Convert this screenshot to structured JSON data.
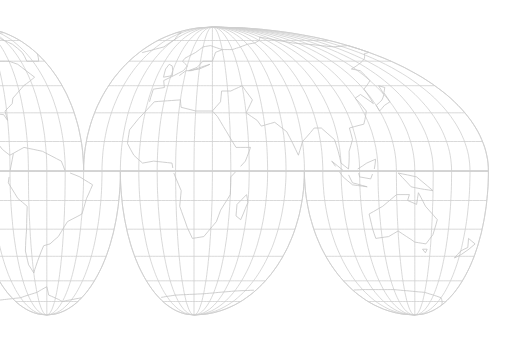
{
  "map": {
    "title": "",
    "projection": "interrupted-homolosine",
    "colors": {
      "background": "#ffffff",
      "graticule": "#cfcfcf",
      "coastline": "#c4c4c4"
    },
    "graticule": {
      "meridian_step_deg": 10,
      "parallel_step_deg": 15
    },
    "lobes": [
      {
        "name": "north-america",
        "hemisphere": "north",
        "lon_min": -180,
        "lon_max": -40,
        "central_meridian": -100
      },
      {
        "name": "eurasia",
        "hemisphere": "north",
        "lon_min": -40,
        "lon_max": 180,
        "central_meridian": 30
      },
      {
        "name": "south-america",
        "hemisphere": "south",
        "lon_min": -100,
        "lon_max": -20,
        "central_meridian": -60
      },
      {
        "name": "africa",
        "hemisphere": "south",
        "lon_min": -20,
        "lon_max": 80,
        "central_meridian": 20
      },
      {
        "name": "australia",
        "hemisphere": "south",
        "lon_min": 80,
        "lon_max": 180,
        "central_meridian": 140
      }
    ],
    "coastlines": [
      {
        "name": "north-america",
        "points": [
          [
            -168,
            66
          ],
          [
            -160,
            70
          ],
          [
            -140,
            70
          ],
          [
            -125,
            70
          ],
          [
            -110,
            68
          ],
          [
            -95,
            72
          ],
          [
            -85,
            68
          ],
          [
            -80,
            63
          ],
          [
            -92,
            58
          ],
          [
            -82,
            54
          ],
          [
            -78,
            60
          ],
          [
            -70,
            60
          ],
          [
            -64,
            58
          ],
          [
            -60,
            54
          ],
          [
            -56,
            50
          ],
          [
            -66,
            45
          ],
          [
            -70,
            42
          ],
          [
            -75,
            38
          ],
          [
            -76,
            35
          ],
          [
            -81,
            31
          ],
          [
            -80,
            26
          ],
          [
            -82,
            29
          ],
          [
            -90,
            30
          ],
          [
            -97,
            27
          ],
          [
            -97,
            22
          ],
          [
            -92,
            19
          ],
          [
            -87,
            21
          ],
          [
            -88,
            16
          ],
          [
            -84,
            11
          ],
          [
            -80,
            8
          ],
          [
            -78,
            9
          ]
        ]
      },
      {
        "name": "greenland",
        "points": [
          [
            -55,
            60
          ],
          [
            -45,
            60
          ],
          [
            -40,
            65
          ],
          [
            -22,
            70
          ],
          [
            -20,
            76
          ],
          [
            -30,
            82
          ],
          [
            -50,
            82
          ],
          [
            -65,
            78
          ],
          [
            -55,
            72
          ],
          [
            -53,
            66
          ],
          [
            -55,
            60
          ]
        ]
      },
      {
        "name": "south-america",
        "points": [
          [
            -78,
            9
          ],
          [
            -72,
            12
          ],
          [
            -62,
            10
          ],
          [
            -52,
            5
          ],
          [
            -50,
            0
          ],
          [
            -42,
            -3
          ],
          [
            -35,
            -7
          ],
          [
            -38,
            -14
          ],
          [
            -40,
            -22
          ],
          [
            -48,
            -26
          ],
          [
            -53,
            -34
          ],
          [
            -58,
            -38
          ],
          [
            -62,
            -39
          ],
          [
            -65,
            -45
          ],
          [
            -68,
            -51
          ],
          [
            -70,
            -55
          ],
          [
            -73,
            -50
          ],
          [
            -74,
            -42
          ],
          [
            -72,
            -30
          ],
          [
            -71,
            -18
          ],
          [
            -76,
            -14
          ],
          [
            -81,
            -6
          ],
          [
            -80,
            0
          ],
          [
            -78,
            9
          ]
        ]
      },
      {
        "name": "europe-africa",
        "points": [
          [
            -9,
            36
          ],
          [
            -9,
            43
          ],
          [
            -2,
            44
          ],
          [
            -4,
            48
          ],
          [
            2,
            51
          ],
          [
            8,
            54
          ],
          [
            10,
            57
          ],
          [
            5,
            60
          ],
          [
            6,
            62
          ],
          [
            14,
            66
          ],
          [
            20,
            70
          ],
          [
            28,
            71
          ],
          [
            40,
            68
          ],
          [
            33,
            66
          ],
          [
            30,
            60
          ],
          [
            22,
            60
          ],
          [
            18,
            56
          ],
          [
            12,
            54
          ],
          [
            20,
            55
          ],
          [
            28,
            58
          ],
          [
            24,
            57
          ],
          [
            14,
            54
          ],
          [
            10,
            54
          ],
          [
            6,
            51
          ]
        ]
      },
      {
        "name": "africa",
        "points": [
          [
            -6,
            36
          ],
          [
            10,
            37
          ],
          [
            11,
            33
          ],
          [
            20,
            31
          ],
          [
            30,
            31
          ],
          [
            33,
            28
          ],
          [
            38,
            20
          ],
          [
            43,
            12
          ],
          [
            51,
            12
          ],
          [
            48,
            5
          ],
          [
            40,
            -3
          ],
          [
            40,
            -12
          ],
          [
            35,
            -20
          ],
          [
            33,
            -26
          ],
          [
            26,
            -34
          ],
          [
            19,
            -35
          ],
          [
            16,
            -29
          ],
          [
            12,
            -18
          ],
          [
            13,
            -10
          ],
          [
            9,
            -1
          ],
          [
            8,
            4
          ],
          [
            -2,
            5
          ],
          [
            -8,
            4
          ],
          [
            -13,
            8
          ],
          [
            -17,
            14
          ],
          [
            -17,
            21
          ],
          [
            -13,
            27
          ],
          [
            -9,
            32
          ],
          [
            -6,
            36
          ]
        ]
      },
      {
        "name": "asia",
        "points": [
          [
            30,
            31
          ],
          [
            35,
            36
          ],
          [
            36,
            42
          ],
          [
            42,
            42
          ],
          [
            50,
            45
          ],
          [
            55,
            37
          ],
          [
            50,
            30
          ],
          [
            56,
            26
          ],
          [
            58,
            23
          ],
          [
            66,
            25
          ],
          [
            72,
            20
          ],
          [
            77,
            8
          ],
          [
            80,
            15
          ],
          [
            88,
            22
          ],
          [
            92,
            22
          ],
          [
            98,
            16
          ],
          [
            100,
            4
          ],
          [
            104,
            1
          ],
          [
            105,
            10
          ],
          [
            108,
            16
          ],
          [
            108,
            22
          ],
          [
            117,
            24
          ],
          [
            122,
            31
          ],
          [
            120,
            38
          ],
          [
            125,
            40
          ],
          [
            129,
            35
          ],
          [
            130,
            43
          ],
          [
            140,
            48
          ],
          [
            142,
            54
          ],
          [
            137,
            55
          ],
          [
            156,
            60
          ],
          [
            163,
            62
          ],
          [
            172,
            65
          ],
          [
            180,
            66
          ],
          [
            180,
            71
          ],
          [
            160,
            70
          ],
          [
            140,
            72
          ],
          [
            125,
            73
          ],
          [
            110,
            76
          ],
          [
            100,
            78
          ],
          [
            90,
            75
          ],
          [
            80,
            73
          ],
          [
            70,
            72
          ],
          [
            60,
            70
          ],
          [
            50,
            68
          ],
          [
            40,
            68
          ]
        ]
      },
      {
        "name": "madagascar",
        "points": [
          [
            44,
            -17
          ],
          [
            49,
            -12
          ],
          [
            50,
            -16
          ],
          [
            47,
            -25
          ],
          [
            44,
            -23
          ],
          [
            44,
            -17
          ]
        ]
      },
      {
        "name": "british-isles",
        "points": [
          [
            -5,
            50
          ],
          [
            1,
            51
          ],
          [
            0,
            54
          ],
          [
            -2,
            57
          ],
          [
            -5,
            58
          ],
          [
            -6,
            55
          ],
          [
            -5,
            50
          ]
        ]
      },
      {
        "name": "japan",
        "points": [
          [
            130,
            31
          ],
          [
            135,
            34
          ],
          [
            140,
            36
          ],
          [
            141,
            41
          ],
          [
            145,
            44
          ],
          [
            142,
            45
          ],
          [
            140,
            40
          ],
          [
            136,
            37
          ],
          [
            130,
            34
          ],
          [
            130,
            31
          ]
        ]
      },
      {
        "name": "australia",
        "points": [
          [
            114,
            -22
          ],
          [
            122,
            -18
          ],
          [
            130,
            -12
          ],
          [
            137,
            -12
          ],
          [
            136,
            -15
          ],
          [
            141,
            -17
          ],
          [
            142,
            -11
          ],
          [
            146,
            -18
          ],
          [
            153,
            -25
          ],
          [
            151,
            -33
          ],
          [
            147,
            -38
          ],
          [
            140,
            -37
          ],
          [
            135,
            -34
          ],
          [
            130,
            -31
          ],
          [
            124,
            -34
          ],
          [
            116,
            -35
          ],
          [
            115,
            -30
          ],
          [
            114,
            -22
          ]
        ]
      },
      {
        "name": "new-guinea",
        "points": [
          [
            131,
            -1
          ],
          [
            141,
            -3
          ],
          [
            150,
            -10
          ],
          [
            143,
            -9
          ],
          [
            138,
            -8
          ],
          [
            131,
            -1
          ]
        ]
      },
      {
        "name": "borneo",
        "points": [
          [
            109,
            1
          ],
          [
            114,
            4
          ],
          [
            119,
            6
          ],
          [
            118,
            1
          ],
          [
            116,
            -4
          ],
          [
            110,
            -3
          ],
          [
            109,
            1
          ]
        ]
      },
      {
        "name": "sumatra-java",
        "points": [
          [
            95,
            5
          ],
          [
            104,
            -2
          ],
          [
            106,
            -6
          ],
          [
            114,
            -8
          ],
          [
            106,
            -7
          ],
          [
            101,
            -3
          ],
          [
            95,
            5
          ]
        ]
      },
      {
        "name": "new-zealand",
        "points": [
          [
            173,
            -35
          ],
          [
            178,
            -38
          ],
          [
            175,
            -41
          ],
          [
            171,
            -44
          ],
          [
            167,
            -46
          ],
          [
            170,
            -42
          ],
          [
            174,
            -40
          ],
          [
            173,
            -35
          ]
        ]
      },
      {
        "name": "tasmania",
        "points": [
          [
            145,
            -41
          ],
          [
            148,
            -41
          ],
          [
            147,
            -43
          ],
          [
            145,
            -41
          ]
        ]
      },
      {
        "name": "antarctica",
        "points": [
          [
            -180,
            -78
          ],
          [
            -150,
            -77
          ],
          [
            -120,
            -74
          ],
          [
            -90,
            -72
          ],
          [
            -70,
            -68
          ],
          [
            -60,
            -64
          ],
          [
            -58,
            -70
          ],
          [
            -40,
            -75
          ],
          [
            -20,
            -72
          ],
          [
            0,
            -70
          ],
          [
            30,
            -69
          ],
          [
            60,
            -67
          ],
          [
            90,
            -66
          ],
          [
            120,
            -66
          ],
          [
            150,
            -68
          ],
          [
            170,
            -72
          ],
          [
            180,
            -78
          ]
        ]
      }
    ]
  }
}
